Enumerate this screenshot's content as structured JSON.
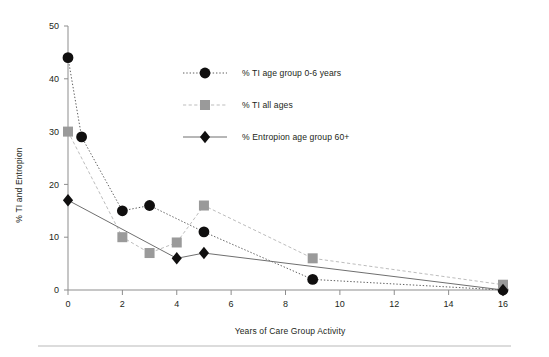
{
  "chart_data": {
    "type": "line",
    "title": "",
    "xlabel": "Years of Care Group Activity",
    "ylabel": "% TI and Entropion",
    "xlim": [
      0,
      16
    ],
    "ylim": [
      0,
      50
    ],
    "xticks": [
      0,
      2,
      4,
      6,
      8,
      10,
      12,
      14,
      16
    ],
    "yticks": [
      0,
      10,
      20,
      30,
      40,
      50
    ],
    "xtick_labels": [
      "0",
      "2",
      "4",
      "6",
      "8",
      "10",
      "12",
      "14",
      "16"
    ],
    "ytick_labels": [
      "0",
      "10",
      "20",
      "30",
      "40",
      "50"
    ],
    "grid": false,
    "legend_position": "inside-upper-center",
    "series": [
      {
        "name": "% TI age group 0-6 years",
        "marker": "circle",
        "color": "#100f0f",
        "line_style": "dotted",
        "points": [
          {
            "x": 0,
            "y": 44
          },
          {
            "x": 0.5,
            "y": 29
          },
          {
            "x": 2,
            "y": 15
          },
          {
            "x": 3,
            "y": 16
          },
          {
            "x": 5,
            "y": 11
          },
          {
            "x": 9,
            "y": 2
          },
          {
            "x": 16,
            "y": 0
          }
        ]
      },
      {
        "name": "% TI all ages",
        "marker": "square",
        "color": "#9a9a9a",
        "line_style": "dashed",
        "points": [
          {
            "x": 0,
            "y": 30
          },
          {
            "x": 2,
            "y": 10
          },
          {
            "x": 3,
            "y": 7
          },
          {
            "x": 4,
            "y": 9
          },
          {
            "x": 5,
            "y": 16
          },
          {
            "x": 9,
            "y": 6
          },
          {
            "x": 16,
            "y": 1
          }
        ]
      },
      {
        "name": "% Entropion age group 60+",
        "marker": "diamond",
        "color": "#100f0f",
        "line_style": "solid",
        "points": [
          {
            "x": 0,
            "y": 17
          },
          {
            "x": 4,
            "y": 6
          },
          {
            "x": 5,
            "y": 7
          },
          {
            "x": 16,
            "y": 0
          }
        ]
      }
    ]
  },
  "legend": {
    "entries": [
      {
        "label": "% TI age group 0-6 years"
      },
      {
        "label": "% TI all ages"
      },
      {
        "label": "% Entropion age group 60+"
      }
    ]
  }
}
